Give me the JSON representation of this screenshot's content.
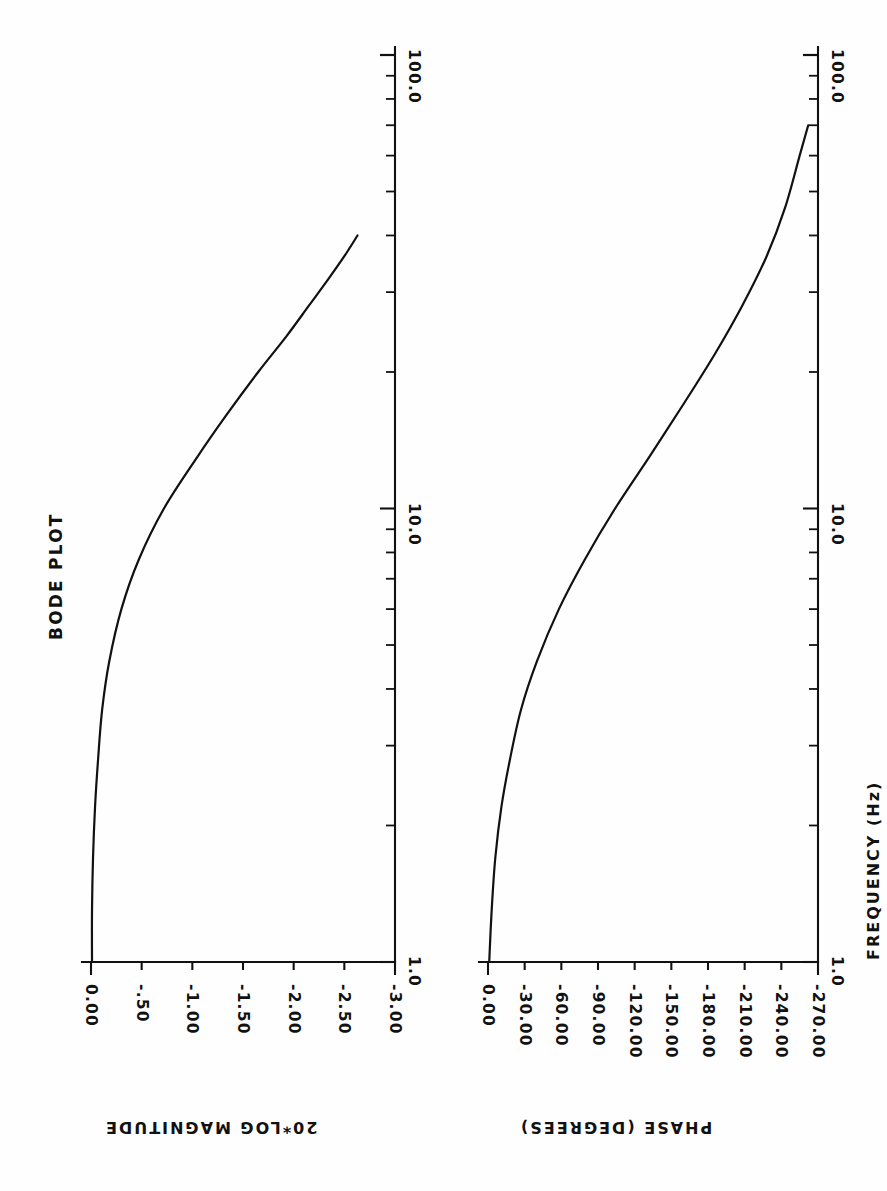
{
  "figure": {
    "title": "BODE PLOT",
    "orientation": "rotated-90-landscape",
    "background_color": "#ffffff",
    "ink_color": "#111111"
  },
  "shared_axis": {
    "label": "FREQUENCY  (Hz)",
    "scale": "log",
    "unit": "Hz",
    "decade_labels": [
      "1.0",
      "10.0",
      "100.0"
    ],
    "min": 1.0,
    "max": 100.0
  },
  "magnitude_panel": {
    "axis_title": "20*LOG MAGNITUDE",
    "tick_labels": [
      "0.00",
      "-.50",
      "-1.00",
      "-1.50",
      "-2.00",
      "-2.50",
      "-3.00"
    ],
    "tick_values": [
      0.0,
      -0.5,
      -1.0,
      -1.5,
      -2.0,
      -2.5,
      -3.0
    ],
    "min": -3.0,
    "max": 0.0,
    "unit": "dB"
  },
  "phase_panel": {
    "axis_title": "PHASE  (DEGREES)",
    "tick_labels": [
      "0.00",
      "-30.00",
      "-60.00",
      "-90.00",
      "-120.00",
      "-150.00",
      "-180.00",
      "-210.00",
      "-240.00",
      "-270.00"
    ],
    "tick_values": [
      0,
      -30,
      -60,
      -90,
      -120,
      -150,
      -180,
      -210,
      -240,
      -270
    ],
    "min": -270,
    "max": 0,
    "unit": "degrees"
  },
  "chart_data": {
    "type": "line",
    "title": "BODE PLOT",
    "xlabel": "FREQUENCY  (Hz)",
    "xscale": "log",
    "xlim": [
      1.0,
      100.0
    ],
    "grid": false,
    "legend": "none",
    "panels": [
      {
        "name": "magnitude",
        "ylabel": "20*LOG MAGNITUDE",
        "ylim": [
          -3.0,
          0.0
        ],
        "yticks": [
          0.0,
          -0.5,
          -1.0,
          -1.5,
          -2.0,
          -2.5,
          -3.0
        ],
        "ytick_labels": [
          "0.00",
          "-.50",
          "-1.00",
          "-1.50",
          "-2.00",
          "-2.50",
          "-3.00"
        ],
        "x": [
          1.0,
          1.3,
          1.7,
          2.2,
          2.8,
          3.6,
          4.6,
          6.0,
          7.7,
          10.0,
          13.0,
          16.0,
          20.0,
          24.0,
          28.0,
          32.0,
          36.0,
          40.0
        ],
        "y": [
          -0.01,
          -0.01,
          -0.02,
          -0.04,
          -0.07,
          -0.11,
          -0.18,
          -0.3,
          -0.47,
          -0.72,
          -1.05,
          -1.33,
          -1.65,
          -1.93,
          -2.15,
          -2.34,
          -2.5,
          -2.63
        ]
      },
      {
        "name": "phase",
        "ylabel": "PHASE  (DEGREES)",
        "ylim": [
          -270,
          0
        ],
        "yticks": [
          0,
          -30,
          -60,
          -90,
          -120,
          -150,
          -180,
          -210,
          -240,
          -270
        ],
        "ytick_labels": [
          "0.00",
          "-30.00",
          "-60.00",
          "-90.00",
          "-120.00",
          "-150.00",
          "-180.00",
          "-210.00",
          "-240.00",
          "-270.00"
        ],
        "x": [
          1.0,
          1.3,
          1.7,
          2.2,
          2.8,
          3.6,
          4.6,
          6.0,
          7.7,
          10.0,
          13.0,
          17.0,
          22.0,
          28.0,
          36.0,
          46.0,
          60.0,
          70.0
        ],
        "y": [
          -1.0,
          -3.0,
          -6.0,
          -11.0,
          -18.0,
          -27.0,
          -40.0,
          -58.0,
          -79.0,
          -104.0,
          -132.0,
          -160.0,
          -186.0,
          -208.0,
          -228.0,
          -243.0,
          -255.0,
          -262.0
        ]
      }
    ]
  }
}
